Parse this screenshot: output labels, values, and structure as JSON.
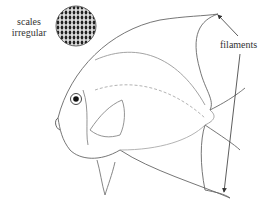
{
  "labels": {
    "scales_line1": "scales",
    "scales_line2": "irregular",
    "filaments": "filaments"
  },
  "figure": {
    "inset": "circular close-up of irregular scales",
    "arrows": [
      "filaments to dorsal fin tip",
      "filaments to anal fin tip"
    ],
    "line_color": "#555555"
  }
}
